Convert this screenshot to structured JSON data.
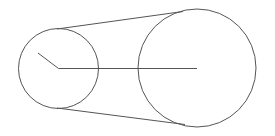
{
  "diagram": {
    "type": "belt-pulley",
    "stroke_color": "#555555",
    "background": "#ffffff",
    "small_pulley": {
      "cx": 58.5,
      "cy": 68.5,
      "r": 40
    },
    "large_pulley": {
      "cx": 197,
      "cy": 68,
      "r": 59
    },
    "center_line": {
      "x1": 58.5,
      "y1": 68.5,
      "x2": 197,
      "y2": 68.5
    },
    "radius_segment": {
      "x1": 38,
      "y1": 53,
      "x2": 58.5,
      "y2": 68.5
    },
    "top_belt": {
      "x1": 57,
      "y1": 29,
      "x2": 183,
      "y2": 11.5
    },
    "bottom_belt": {
      "x1": 57,
      "y1": 108,
      "x2": 185,
      "y2": 124.5
    }
  }
}
